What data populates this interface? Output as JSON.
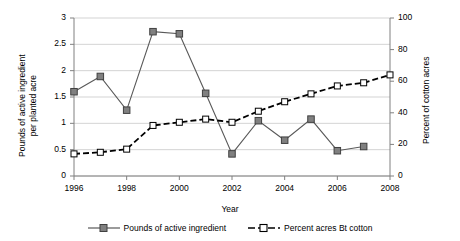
{
  "chart_data": {
    "type": "line",
    "title": "",
    "xlabel": "Year",
    "ylabel": "Pounds of active ingredient\nper planted acre",
    "ylabel_right": "Percent of cotton acres",
    "x": [
      1996,
      1997,
      1998,
      1999,
      2000,
      2001,
      2002,
      2003,
      2004,
      2005,
      2006,
      2007,
      2008
    ],
    "xtick_labels": [
      "1996",
      "1998",
      "2000",
      "2002",
      "2004",
      "2006",
      "2008"
    ],
    "xticks": [
      1996,
      1998,
      2000,
      2002,
      2004,
      2006,
      2008
    ],
    "xlim": [
      1996,
      2008
    ],
    "ylim": [
      0,
      3
    ],
    "ylim_right": [
      0,
      100
    ],
    "ytick_labels_left": [
      "0",
      "0.5",
      "1",
      "1.5",
      "2",
      "2.5",
      "3"
    ],
    "yticks_left": [
      0,
      0.5,
      1,
      1.5,
      2,
      2.5,
      3
    ],
    "ytick_labels_right": [
      "0",
      "20",
      "40",
      "60",
      "80",
      "100"
    ],
    "yticks_right": [
      0,
      20,
      40,
      60,
      80,
      100
    ],
    "grid": true,
    "grid_color": "#c8c8c8",
    "legend_position": "bottom",
    "series": [
      {
        "name": "Pounds of active ingredient",
        "axis": "left",
        "marker": "filled-square",
        "line_style": "solid",
        "color": "#595959",
        "marker_fill": "#808080",
        "values": [
          1.6,
          1.89,
          1.25,
          2.74,
          2.7,
          1.57,
          0.42,
          1.05,
          0.68,
          1.08,
          0.48,
          0.56,
          null
        ]
      },
      {
        "name": "Percent acres Bt cotton",
        "axis": "right",
        "marker": "open-square",
        "line_style": "dashed",
        "color": "#000000",
        "marker_fill": "#ffffff",
        "values_right": [
          14,
          15,
          17,
          32,
          34,
          36,
          34,
          41,
          47,
          52,
          57,
          59,
          62,
          64
        ],
        "values": [
          14,
          15,
          17,
          32,
          34,
          36,
          34,
          41,
          47,
          52,
          57,
          59,
          64
        ]
      }
    ]
  },
  "legend": {
    "entries": [
      {
        "label": "Pounds of active ingredient"
      },
      {
        "label": "Percent acres Bt cotton"
      }
    ]
  }
}
